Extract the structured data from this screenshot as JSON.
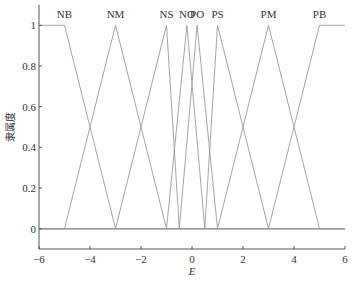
{
  "chart_data": {
    "type": "line",
    "title": "",
    "xlabel": "E",
    "ylabel": "隶属度",
    "xlim": [
      -6,
      6
    ],
    "ylim": [
      -0.1,
      1.1
    ],
    "xticks": [
      -6,
      -4,
      -2,
      0,
      2,
      4,
      6
    ],
    "yticks": [
      0,
      0.2,
      0.4,
      0.6,
      0.8,
      1
    ],
    "xtick_labels": [
      "−6",
      "−4",
      "−2",
      "0",
      "2",
      "4",
      "6"
    ],
    "ytick_labels": [
      "0",
      "0.2",
      "0.4",
      "0.6",
      "0.8",
      "1"
    ],
    "grid": false,
    "legend": "none (labels placed above peaks)",
    "series": [
      {
        "name": "NB",
        "x": [
          -6,
          -5,
          -3,
          6
        ],
        "y": [
          1,
          1,
          0,
          0
        ],
        "label_x": -5
      },
      {
        "name": "NM",
        "x": [
          -6,
          -5,
          -3,
          -1,
          6
        ],
        "y": [
          0,
          0,
          1,
          0,
          0
        ],
        "label_x": -3
      },
      {
        "name": "NS",
        "x": [
          -6,
          -3,
          -1,
          -0.5,
          6
        ],
        "y": [
          0,
          0,
          1,
          0,
          0
        ],
        "label_x": -1
      },
      {
        "name": "NO",
        "x": [
          -6,
          -1,
          -0.2,
          0.5,
          6
        ],
        "y": [
          0,
          0,
          1,
          0,
          0
        ],
        "label_x": -0.2
      },
      {
        "name": "PO",
        "x": [
          -6,
          -0.5,
          0.2,
          1,
          6
        ],
        "y": [
          0,
          0,
          1,
          0,
          0
        ],
        "label_x": 0.2
      },
      {
        "name": "PS",
        "x": [
          -6,
          0.5,
          1,
          3,
          6
        ],
        "y": [
          0,
          0,
          1,
          0,
          0
        ],
        "label_x": 1
      },
      {
        "name": "PM",
        "x": [
          -6,
          1,
          3,
          5,
          6
        ],
        "y": [
          0,
          0,
          1,
          0,
          0
        ],
        "label_x": 3
      },
      {
        "name": "PB",
        "x": [
          -6,
          3,
          5,
          6
        ],
        "y": [
          0,
          0,
          1,
          1
        ],
        "label_x": 5
      }
    ]
  }
}
